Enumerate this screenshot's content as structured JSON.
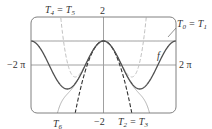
{
  "chart_data": {
    "type": "line",
    "title": "",
    "xlabel": "",
    "ylabel": "",
    "xlim": [
      -6.2832,
      6.2832
    ],
    "ylim": [
      -2,
      2
    ],
    "grid": false,
    "tick_labels": {
      "x_left": "−2 π",
      "x_right": "2 π",
      "y_top": "2",
      "y_bottom": "−2"
    },
    "series": [
      {
        "name": "f",
        "label": "f",
        "expr": "cos(x)",
        "style": "solid",
        "color": "#555555"
      },
      {
        "name": "T0 = T1",
        "label_parts": [
          "T",
          "0",
          " = T",
          "1"
        ],
        "expr": "1",
        "style": "solid",
        "color": "#888888"
      },
      {
        "name": "T2 = T3",
        "label_parts": [
          "T",
          "2",
          " = T",
          "3"
        ],
        "expr": "1 - x^2/2",
        "style": "dashed",
        "color": "#333333"
      },
      {
        "name": "T4 = T5",
        "label_parts": [
          "T",
          "4",
          " = T",
          "5"
        ],
        "expr": "1 - x^2/2 + x^4/24",
        "style": "dashed",
        "color": "#bbbbbb"
      },
      {
        "name": "T6",
        "label_parts": [
          "T",
          "6"
        ],
        "expr": "1 - x^2/2 + x^4/24 - x^6/720",
        "style": "solid",
        "color": "#aaaaaa"
      }
    ],
    "annotations": [
      {
        "text": "T4 = T5",
        "position": "top-left"
      },
      {
        "text": "T0 = T1",
        "position": "top-right",
        "arrow": true
      },
      {
        "text": "f",
        "position": "right, on curve"
      },
      {
        "text": "T6",
        "position": "bottom-left"
      },
      {
        "text": "T2 = T3",
        "position": "bottom-center-right"
      }
    ]
  },
  "labels": {
    "x_left": "−2 π",
    "x_right": "2 π",
    "y_top": "2",
    "y_bottom": "−2",
    "f": "f",
    "t45_a": "T",
    "t45_a_sub": "4",
    "t45_eq": " = T",
    "t45_b_sub": "5",
    "t01_a": "T",
    "t01_a_sub": "0",
    "t01_eq": " = T",
    "t01_b_sub": "1",
    "t6_a": "T",
    "t6_a_sub": "6",
    "t23_a": "T",
    "t23_a_sub": "2",
    "t23_eq": " = T",
    "t23_b_sub": "3"
  },
  "colors": {
    "frame": "#777777",
    "axis": "#999999",
    "f": "#555555",
    "t01": "#888888",
    "t23": "#333333",
    "t45": "#bbbbbb",
    "t6": "#aaaaaa"
  }
}
